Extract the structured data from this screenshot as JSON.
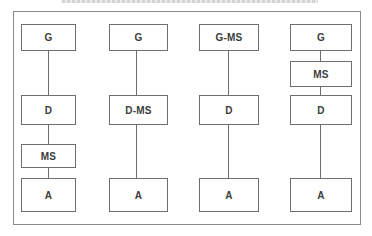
{
  "title": "",
  "diagram": {
    "columns": [
      {
        "id": "config-1",
        "boxes": [
          "G",
          "D",
          "MS",
          "A"
        ]
      },
      {
        "id": "config-2",
        "boxes": [
          "G",
          "D-MS",
          "A"
        ]
      },
      {
        "id": "config-3",
        "boxes": [
          "G-MS",
          "D",
          "A"
        ]
      },
      {
        "id": "config-4",
        "boxes": [
          "G",
          "MS",
          "D",
          "A"
        ]
      }
    ],
    "colors": {
      "stroke": "#6e6e6e",
      "frame": "#8a8a8a",
      "text": "#3c3c3c",
      "background": "#ffffff"
    }
  }
}
